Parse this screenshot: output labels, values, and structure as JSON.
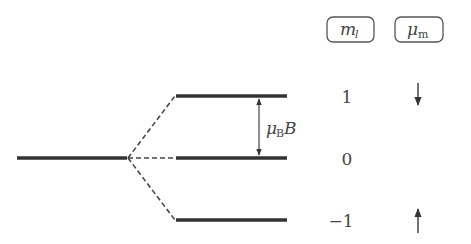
{
  "diagram": {
    "headers": {
      "ml": {
        "symbol": "m",
        "subscript": "l"
      },
      "mu": {
        "symbol": "μ",
        "subscript": "m"
      }
    },
    "splitting_label": {
      "mu": "μ",
      "sub": "B",
      "field": "B"
    },
    "levels": [
      {
        "ml": "1",
        "moment_arrow": "down-arrow"
      },
      {
        "ml": "0",
        "moment_arrow": ""
      },
      {
        "ml": "−1",
        "moment_arrow": "up-arrow"
      }
    ],
    "colors": {
      "line": "#333333",
      "text": "#444444",
      "box": "#555555"
    }
  }
}
